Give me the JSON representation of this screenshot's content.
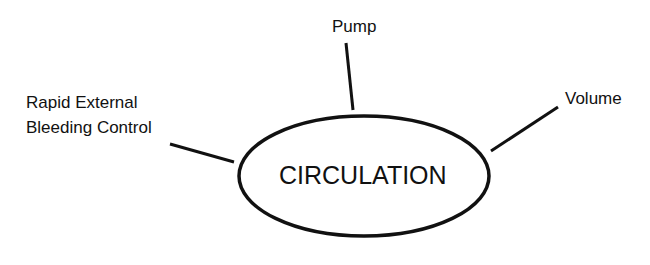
{
  "diagram": {
    "center": {
      "label": "CIRCULATION"
    },
    "nodes": [
      {
        "id": "pump",
        "label": "Pump"
      },
      {
        "id": "volume",
        "label": "Volume"
      },
      {
        "id": "bleeding",
        "label_line1": "Rapid External",
        "label_line2": "Bleeding Control"
      }
    ],
    "colors": {
      "stroke": "#111111",
      "background": "#ffffff"
    }
  }
}
